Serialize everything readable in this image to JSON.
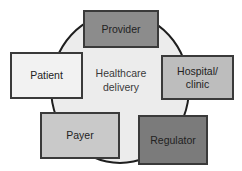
{
  "diagram": {
    "type": "hub-and-spoke",
    "center": {
      "line1": "Healthcare",
      "line2": "delivery"
    },
    "nodes": [
      {
        "id": "provider",
        "label": "Provider",
        "fill": "#8c8c8c"
      },
      {
        "id": "patient",
        "label": "Patient",
        "fill": "#f2f2f2"
      },
      {
        "id": "hospital",
        "line1": "Hospital/",
        "line2": "clinic",
        "fill": "#bdbdbd"
      },
      {
        "id": "payer",
        "label": "Payer",
        "fill": "#c9c9c9"
      },
      {
        "id": "regulator",
        "label": "Regulator",
        "fill": "#7b7b7b"
      }
    ],
    "colors": {
      "circle_fill": "#ececec",
      "outline": "#1e1e1e"
    }
  }
}
